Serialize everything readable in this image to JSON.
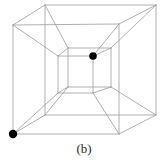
{
  "figure": {
    "caption": "(b)",
    "type": "wireframe-tesseract",
    "background_color": "#ffffff",
    "edge_color": "#9c9c9c",
    "edge_width": 0.8,
    "dot_color": "#000000",
    "vertices": {
      "outer_front": {
        "TL": [
          13,
          25
        ],
        "TR": [
          119,
          24
        ],
        "BR": [
          119,
          134
        ],
        "BL": [
          13,
          134
        ]
      },
      "outer_back": {
        "TL": [
          45,
          5
        ],
        "TR": [
          156,
          5
        ],
        "BR": [
          156,
          115
        ],
        "BL": [
          45,
          115
        ]
      },
      "inner_front": {
        "TL": [
          58,
          56
        ],
        "TR": [
          93,
          56
        ],
        "BR": [
          93,
          93
        ],
        "BL": [
          58,
          93
        ]
      },
      "inner_back": {
        "TL": [
          68,
          48
        ],
        "TR": [
          111,
          48
        ],
        "BR": [
          111,
          87
        ],
        "BL": [
          68,
          87
        ]
      }
    },
    "marked_vertices": [
      {
        "name": "outer-front-bottom-left-vertex",
        "x": 13,
        "y": 134,
        "r": 4.2
      },
      {
        "name": "inner-front-top-right-vertex",
        "x": 93,
        "y": 56,
        "r": 3.8
      }
    ]
  }
}
